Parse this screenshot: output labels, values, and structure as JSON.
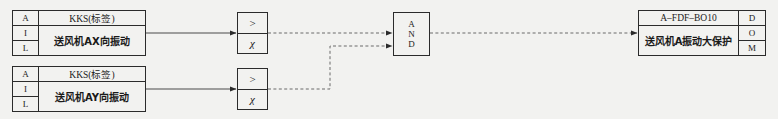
{
  "diagram": {
    "background_color": "#f2f2f0",
    "line_color": "#2b2b2b"
  },
  "inputs": [
    {
      "tag_labels": [
        "A",
        "I",
        "L"
      ],
      "kks_header": "KKS(标签)",
      "description": "送风机AX向振动"
    },
    {
      "tag_labels": [
        "A",
        "I",
        "L"
      ],
      "kks_header": "KKS(标签)",
      "description": "送风机AY向振动"
    }
  ],
  "comparators": [
    {
      "operator": ">",
      "setpoint": "χ"
    },
    {
      "operator": ">",
      "setpoint": "χ"
    }
  ],
  "gate": {
    "type": "AND",
    "letters": [
      "A",
      "N",
      "D"
    ]
  },
  "output": {
    "kks_header": "A–FDF–BO10",
    "description": "送风机A振动大保护",
    "tag_labels": [
      "D",
      "O",
      "M"
    ]
  },
  "connections": {
    "input1_to_comparator1": "solid",
    "input2_to_comparator2": "solid",
    "comparator1_to_gate": "dashed",
    "comparator2_to_gate": "dashed",
    "gate_to_output": "dashed"
  }
}
